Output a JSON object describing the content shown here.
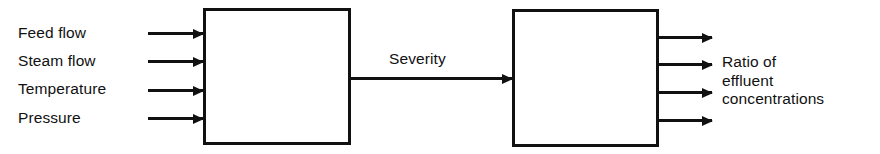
{
  "diagram": {
    "background_color": "#ffffff",
    "stroke_color": "#111111",
    "inputs": {
      "labels": [
        "Feed flow",
        "Steam flow",
        "Temperature",
        "Pressure"
      ]
    },
    "blocks": [
      {
        "id": "left",
        "label": ""
      },
      {
        "id": "right",
        "label": ""
      }
    ],
    "connector": {
      "label": "Severity"
    },
    "outputs": {
      "label_lines": [
        "Ratio of",
        "effluent",
        "concentrations"
      ],
      "arrow_count": 4
    }
  }
}
